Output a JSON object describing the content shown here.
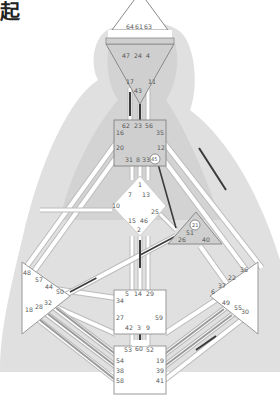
{
  "header": {
    "title_fragment": "起"
  },
  "colors": {
    "background": "#ffffff",
    "silhouette": "#d6d6d6",
    "center_defined": "#cfcfcf",
    "center_open": "#ffffff",
    "center_border": "#8a8a8a",
    "channel_open": "#ffffff",
    "channel_border": "#bdbdbd",
    "activation_dark": "#3a3a3a",
    "activation_gray": "#9a9a9a",
    "gate_text": "#555555"
  },
  "centers": {
    "head": {
      "label": "Head",
      "defined": false,
      "gates": [
        "64",
        "61",
        "63"
      ]
    },
    "ajna": {
      "label": "Ajna",
      "defined": true,
      "gates": [
        "47",
        "24",
        "4",
        "17",
        "11",
        "43"
      ]
    },
    "throat": {
      "label": "Throat",
      "defined": true,
      "gates": [
        "62",
        "23",
        "56",
        "16",
        "35",
        "20",
        "12",
        "31",
        "8",
        "33",
        "45"
      ]
    },
    "g": {
      "label": "G",
      "defined": false,
      "gates": [
        "1",
        "7",
        "13",
        "10",
        "25",
        "15",
        "46",
        "2"
      ]
    },
    "heart": {
      "label": "Heart",
      "defined": true,
      "gates": [
        "21",
        "51",
        "26",
        "40"
      ]
    },
    "spleen": {
      "label": "Spleen",
      "defined": false,
      "gates": [
        "48",
        "57",
        "44",
        "50",
        "18",
        "28",
        "32"
      ]
    },
    "solar": {
      "label": "Solar Plexus",
      "defined": false,
      "gates": [
        "36",
        "22",
        "37",
        "6",
        "49",
        "55",
        "30"
      ]
    },
    "sacral": {
      "label": "Sacral",
      "defined": false,
      "gates": [
        "5",
        "14",
        "29",
        "34",
        "27",
        "59",
        "42",
        "3",
        "9"
      ]
    },
    "root": {
      "label": "Root",
      "defined": false,
      "gates": [
        "53",
        "60",
        "52",
        "54",
        "19",
        "38",
        "39",
        "58",
        "41"
      ]
    }
  },
  "gate_labels": {
    "g64": "64",
    "g61": "61",
    "g63": "63",
    "g47": "47",
    "g24": "24",
    "g4": "4",
    "g17": "17",
    "g11": "11",
    "g43": "43",
    "g62": "62",
    "g23": "23",
    "g56": "56",
    "g16": "16",
    "g35": "35",
    "g20": "20",
    "g12": "12",
    "g31": "31",
    "g8": "8",
    "g33": "33",
    "g45": "45",
    "g1": "1",
    "g7": "7",
    "g13": "13",
    "g10": "10",
    "g25": "25",
    "g15": "15",
    "g46": "46",
    "g2": "2",
    "g21": "21",
    "g51": "51",
    "g26": "26",
    "g40": "40",
    "g48": "48",
    "g57": "57",
    "g44": "44",
    "g50": "50",
    "g18": "18",
    "g28": "28",
    "g32": "32",
    "g36": "36",
    "g22": "22",
    "g37": "37",
    "g6": "6",
    "g49": "49",
    "g55": "55",
    "g30": "30",
    "g5": "5",
    "g14": "14",
    "g29": "29",
    "g34": "34",
    "g27": "27",
    "g59": "59",
    "g42": "42",
    "g3": "3",
    "g9": "9",
    "g53": "53",
    "g60": "60",
    "g52": "52",
    "g54": "54",
    "g19": "19",
    "g38": "38",
    "g39": "39",
    "g58": "58",
    "g41": "41"
  },
  "activated_channels": [
    {
      "gates": "47-64",
      "state": "partial"
    },
    {
      "gates": "17-62",
      "state": "hanging"
    },
    {
      "gates": "43-23",
      "state": "hanging"
    },
    {
      "gates": "45-21",
      "state": "defined"
    },
    {
      "gates": "2-14",
      "state": "hanging"
    },
    {
      "gates": "26-44",
      "state": "hanging"
    },
    {
      "gates": "12-22",
      "state": "hanging"
    },
    {
      "gates": "3-60",
      "state": "hanging"
    },
    {
      "gates": "55-39",
      "state": "hanging"
    },
    {
      "gates": "28-38",
      "state": "hanging"
    },
    {
      "gates": "32-54",
      "state": "hanging"
    },
    {
      "gates": "18-58",
      "state": "hanging"
    }
  ]
}
